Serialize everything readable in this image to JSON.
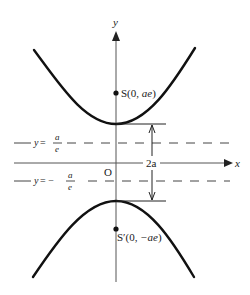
{
  "diagram": {
    "type": "hyperbola",
    "axes": {
      "x_label": "x",
      "y_label": "y",
      "origin_label": "O"
    },
    "foci": [
      {
        "name": "S",
        "label": "S(0, ae)",
        "prefix": "S(0, ",
        "coord": "ae",
        "suffix": ")"
      },
      {
        "name": "S'",
        "label": "S′(0, −ae)",
        "prefix": "S′(0, ",
        "coord": "−ae",
        "suffix": ")"
      }
    ],
    "directrices": [
      {
        "label": "y = a/e",
        "lhs": "y",
        "eq": " = ",
        "num": "a",
        "den": "e"
      },
      {
        "label": "y = − a/e",
        "lhs": "y",
        "eq": " = − ",
        "num": "a",
        "den": "e"
      }
    ],
    "dimension": {
      "label": "2a"
    },
    "colors": {
      "curve": "#111111",
      "axis": "#555555",
      "dash": "#444444",
      "text": "#1a1a1a"
    }
  }
}
